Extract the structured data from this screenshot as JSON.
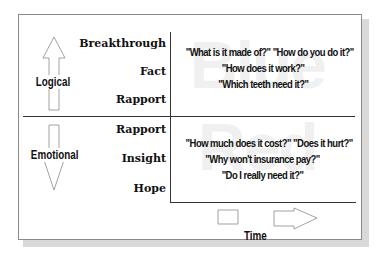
{
  "diagram": {
    "axis_vertical": {
      "top_label": "Logical",
      "bottom_label": "Emotional",
      "top_arrow_direction": "up",
      "bottom_arrow_direction": "down"
    },
    "axis_horizontal": {
      "label": "Time",
      "arrow_direction": "right"
    },
    "logical_levels": [
      "Breakthrough",
      "Fact",
      "Rapport"
    ],
    "emotional_levels": [
      "Rapport",
      "Insight",
      "Hope"
    ],
    "logical_questions": [
      "\"What is it made of?\" \"How do you do it?\"",
      "\"How does it work?\"",
      "\"Which teeth need it?\""
    ],
    "emotional_questions": [
      "\"How much does it cost?\" \"Does it hurt?\"",
      "\"Why won't insurance pay?\"",
      "\"Do I really need it?\""
    ],
    "watermarks": {
      "top": "Blue",
      "bottom": "Red"
    },
    "colors": {
      "line": "#333333",
      "frame": "#8a8a8a",
      "shadow": "#d9d9d9",
      "watermark": "#f0f0f0",
      "text": "#111111"
    }
  }
}
